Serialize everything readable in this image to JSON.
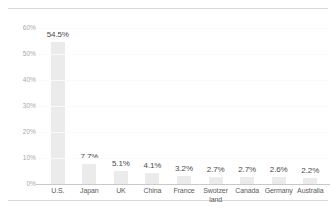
{
  "chart_data": {
    "type": "bar",
    "title": "",
    "subtitle": "",
    "xlabel": "",
    "ylabel": "",
    "categories": [
      "U.S.",
      "Japan",
      "UK",
      "China",
      "France",
      "Swotzer\nland",
      "Canada",
      "Germany",
      "Australia"
    ],
    "values": [
      54.5,
      7.7,
      5.1,
      4.1,
      3.2,
      2.7,
      2.7,
      2.6,
      2.2
    ],
    "value_labels": [
      "54.5%",
      "7.7%",
      "5.1%",
      "4.1%",
      "3.2%",
      "2.7%",
      "2.7%",
      "2.6%",
      "2.2%"
    ],
    "ylim": [
      0,
      60
    ],
    "yticks": [
      60,
      50,
      40,
      30,
      20,
      10,
      0
    ],
    "ytick_labels": [
      "60%",
      "50%",
      "40%",
      "30%",
      "20%",
      "10%",
      "0%"
    ],
    "grid": true,
    "legend": "none",
    "colors": {
      "bar": "#ebebeb",
      "value_label": "#4a4a4a",
      "tick_label": "#a8a8a8",
      "category_label": "#5a5a5a",
      "axis_line": "#c9c9c9",
      "gridline": "#fafafa",
      "rule": "#d8d8d8",
      "background": "#ffffff"
    }
  }
}
